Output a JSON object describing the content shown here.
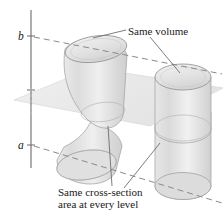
{
  "figure": {
    "type": "geometry-diagram",
    "background_color": "#ffffff"
  },
  "axis": {
    "name": "vertical-axis",
    "upper_label": "b",
    "lower_label": "a",
    "color": "#6b6b6b"
  },
  "annotations": {
    "same_volume": "Same volume",
    "cross_section_line1": "Same cross-section",
    "cross_section_line2": "area at every level"
  },
  "solids": [
    {
      "name": "oblique-cylinder",
      "shape": "bent/oblique cylinder",
      "fill": "#e4e4e4",
      "stroke": "#9a9a9a"
    },
    {
      "name": "right-cylinder",
      "shape": "right circular cylinder",
      "fill": "#e4e4e4",
      "stroke": "#9a9a9a"
    }
  ],
  "plane": {
    "name": "cutting-plane",
    "shape": "parallelogram",
    "fill": "#ededed",
    "stroke": "#d2d2d2"
  },
  "dashed_lines": {
    "upper_level": "b-level",
    "lower_level": "a-level",
    "color": "#8a8a8a"
  },
  "colors": {
    "solid_fill": "#e4e4e4",
    "solid_fill_light": "#efefef",
    "solid_fill_dark": "#d6d6d6",
    "outline": "#9a9a9a",
    "plane_fill": "#ededed",
    "dash": "#8a8a8a",
    "leader": "#6e6e6e",
    "text": "#1a1a1a"
  }
}
